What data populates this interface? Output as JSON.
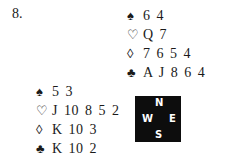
{
  "problem": {
    "number": "8."
  },
  "hands": {
    "north": {
      "suits": [
        {
          "symbol": "♠",
          "name": "spades",
          "cards": "6 4"
        },
        {
          "symbol": "♡",
          "name": "hearts",
          "cards": "Q 7"
        },
        {
          "symbol": "◊",
          "name": "diamonds",
          "cards": "7 6 5 4"
        },
        {
          "symbol": "♣",
          "name": "clubs",
          "cards": "A J 8 6 4"
        }
      ]
    },
    "west": {
      "suits": [
        {
          "symbol": "♠",
          "name": "spades",
          "cards": "5 3"
        },
        {
          "symbol": "♡",
          "name": "hearts",
          "cards": "J 10 8 5 2"
        },
        {
          "symbol": "◊",
          "name": "diamonds",
          "cards": "K 10 3"
        },
        {
          "symbol": "♣",
          "name": "clubs",
          "cards": "K 10 2"
        }
      ]
    }
  },
  "compass": {
    "n": "N",
    "e": "E",
    "s": "S",
    "w": "W",
    "background": "#0d0d0d"
  }
}
